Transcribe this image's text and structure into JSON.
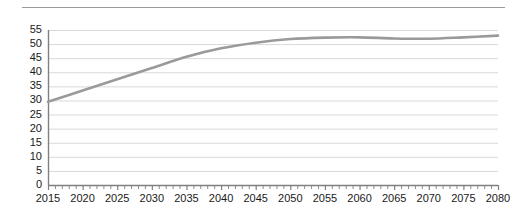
{
  "chart_data": {
    "type": "line",
    "title": "",
    "subtitle": "",
    "xlabel": "",
    "ylabel": "",
    "xlim": [
      2015,
      2080
    ],
    "ylim": [
      0,
      55
    ],
    "grid": true,
    "legend": null,
    "legend_position": "none",
    "line_color": "#9a9a9a",
    "gridline_color": "#d9d9d9",
    "axis_color": "#808080",
    "background_color": "#ffffff",
    "y_ticks": [
      0,
      5,
      10,
      15,
      20,
      25,
      30,
      35,
      40,
      45,
      50,
      55
    ],
    "y_tick_labels": [
      "0",
      "5",
      "10",
      "15",
      "20",
      "25",
      "30",
      "35",
      "40",
      "45",
      "50",
      "55"
    ],
    "x_ticks": [
      2015,
      2020,
      2025,
      2030,
      2035,
      2040,
      2045,
      2050,
      2055,
      2060,
      2065,
      2070,
      2075,
      2080
    ],
    "x_tick_labels": [
      "2015",
      "2020",
      "2025",
      "2030",
      "2035",
      "2040",
      "2045",
      "2050",
      "2055",
      "2060",
      "2065",
      "2070",
      "2075",
      "2080"
    ],
    "x_minor_tick_interval": 1,
    "series": [
      {
        "name": "series-1",
        "x": [
          2015,
          2020,
          2025,
          2030,
          2035,
          2040,
          2045,
          2050,
          2055,
          2060,
          2065,
          2070,
          2075,
          2080
        ],
        "values": [
          29.5,
          33.5,
          37.5,
          41.5,
          45.5,
          48.5,
          50.5,
          51.8,
          52.3,
          52.4,
          52.0,
          51.9,
          52.4,
          53.0
        ]
      }
    ],
    "annotations": []
  },
  "decorations": {
    "top_rule": "horizontal-rule"
  }
}
